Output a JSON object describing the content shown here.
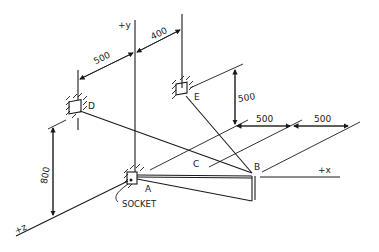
{
  "diagram": {
    "type": "isometric-mechanics-sketch",
    "axes": {
      "y": "+y",
      "x": "+x",
      "z": "+z"
    },
    "points": {
      "A": "A",
      "B": "B",
      "C": "C",
      "D": "D",
      "E": "E"
    },
    "annotations": {
      "socket": "SOCKET"
    },
    "dimensions": {
      "d_to_y": "500",
      "y_to_e": "400",
      "e_height": "500",
      "x_first": "500",
      "x_second": "500",
      "d_height": "800"
    },
    "colors": {
      "ink": "#1a1a1a",
      "background": "#ffffff"
    }
  }
}
